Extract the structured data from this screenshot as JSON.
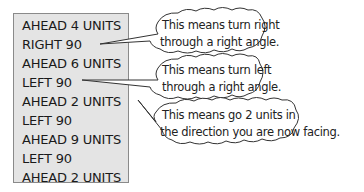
{
  "commands": [
    "AHEAD 4 UNITS",
    "RIGHT 90",
    "AHEAD 6 UNITS",
    "LEFT 90",
    "AHEAD 2 UNITS",
    "LEFT 90",
    "AHEAD 9 UNITS",
    "LEFT 90",
    "AHEAD 2 UNITS"
  ],
  "callouts": [
    {
      "line1": "This means turn right",
      "line2": "through a right angle."
    },
    {
      "line1": "This means turn left",
      "line2": "through a right angle."
    },
    {
      "line1": "This means go 2 units in",
      "line2": "the direction you are now facing."
    }
  ],
  "colors": {
    "box_fill": "#e4e4e4",
    "box_border": "#8a8a8a",
    "text": "#1a1a1a"
  }
}
